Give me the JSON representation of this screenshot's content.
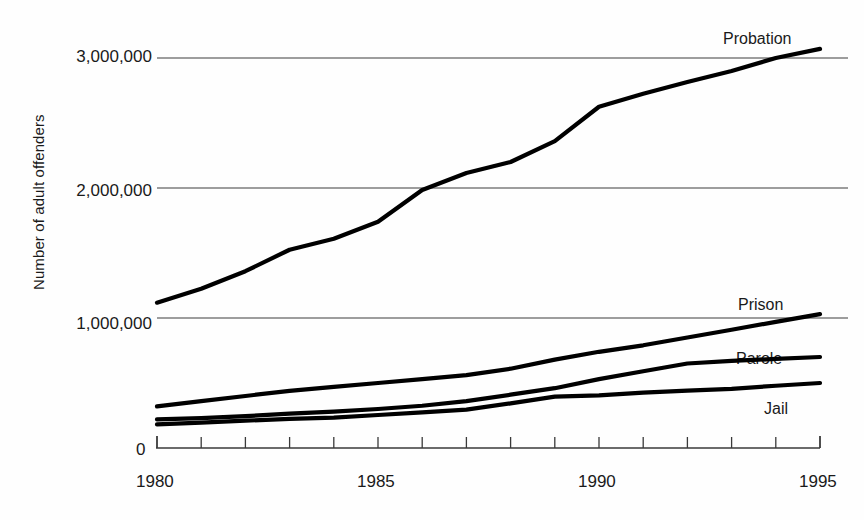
{
  "chart_data": {
    "type": "line",
    "title": "",
    "xlabel": "",
    "ylabel": "Number of adult offenders",
    "xlim": [
      1980,
      1995
    ],
    "ylim": [
      0,
      3300000
    ],
    "xticks": [
      1980,
      1981,
      1982,
      1983,
      1984,
      1985,
      1986,
      1987,
      1988,
      1989,
      1990,
      1991,
      1992,
      1993,
      1994,
      1995
    ],
    "xtick_labels": [
      "1980",
      "",
      "",
      "",
      "",
      "1985",
      "",
      "",
      "",
      "",
      "1990",
      "",
      "",
      "",
      "",
      "1995"
    ],
    "yticks": [
      0,
      1000000,
      2000000,
      3000000
    ],
    "ytick_labels": [
      "0",
      "1,000,000",
      "2,000,000",
      "3,000,000"
    ],
    "grid": "horizontal gridlines at 1,000,000 / 2,000,000 / 3,000,000",
    "legend_position": "inline right end labels",
    "line_color": "#000000",
    "x": [
      1980,
      1981,
      1982,
      1983,
      1984,
      1985,
      1986,
      1987,
      1988,
      1989,
      1990,
      1991,
      1992,
      1993,
      1994,
      1995
    ],
    "series": [
      {
        "name": "Probation",
        "label": "Probation",
        "values": [
          1118000,
          1225000,
          1360000,
          1525000,
          1610000,
          1740000,
          1985000,
          2115000,
          2200000,
          2360000,
          2625000,
          2725000,
          2815000,
          2900000,
          3000000,
          3070000
        ]
      },
      {
        "name": "Prison",
        "label": "Prison",
        "values": [
          320000,
          360000,
          400000,
          440000,
          470000,
          500000,
          530000,
          560000,
          610000,
          680000,
          740000,
          790000,
          850000,
          910000,
          970000,
          1030000
        ]
      },
      {
        "name": "Parole",
        "label": "Parole",
        "values": [
          220000,
          230000,
          245000,
          265000,
          280000,
          300000,
          325000,
          360000,
          410000,
          460000,
          530000,
          590000,
          650000,
          670000,
          685000,
          700000
        ]
      },
      {
        "name": "Jail",
        "label": "Jail",
        "values": [
          182000,
          195000,
          210000,
          224000,
          234000,
          254000,
          274000,
          295000,
          343000,
          395000,
          405000,
          426000,
          441000,
          455000,
          479000,
          500000
        ]
      }
    ]
  },
  "axis": {
    "y_title": "Number of adult offenders",
    "zero_label": "0"
  },
  "labels": {
    "probation": "Probation",
    "prison": "Prison",
    "parole": "Parole",
    "jail": "Jail"
  }
}
